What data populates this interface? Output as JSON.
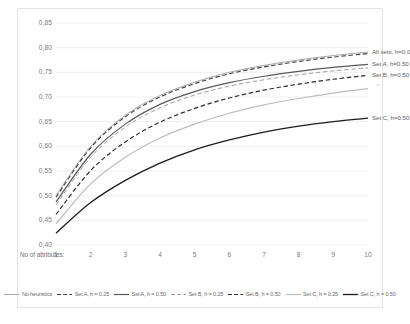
{
  "chart_data": {
    "type": "line",
    "title": "",
    "xlabel": "No of attributes:",
    "ylabel": "",
    "x": [
      1,
      2,
      3,
      4,
      5,
      6,
      7,
      8,
      9,
      10
    ],
    "xlim": [
      1,
      10
    ],
    "ylim": [
      0.4,
      0.85
    ],
    "yticks": [
      "0,40",
      "0,45",
      "0,50",
      "0,55",
      "0,60",
      "0,65",
      "0,70",
      "0,75",
      "0,80",
      "0,85"
    ],
    "ytick_values": [
      0.4,
      0.45,
      0.5,
      0.55,
      0.6,
      0.65,
      0.7,
      0.75,
      0.8,
      0.85
    ],
    "xticks": [
      "1",
      "2",
      "3",
      "4",
      "5",
      "6",
      "7",
      "8",
      "9",
      "10"
    ],
    "grid": "horizontal",
    "legend_position": "bottom",
    "series": [
      {
        "name": "No heuristics",
        "values": [
          0.5,
          0.6,
          0.663,
          0.703,
          0.73,
          0.75,
          0.764,
          0.775,
          0.784,
          0.791
        ],
        "color": "#a6a6a6",
        "style": "solid",
        "width": 1.0
      },
      {
        "name": "Set A, h = 0.25",
        "values": [
          0.497,
          0.597,
          0.66,
          0.7,
          0.727,
          0.747,
          0.761,
          0.772,
          0.781,
          0.788
        ],
        "color": "#3f3f3f",
        "style": "dashed",
        "width": 1.1
      },
      {
        "name": "Set A, h = 0.50",
        "values": [
          0.487,
          0.584,
          0.645,
          0.685,
          0.711,
          0.729,
          0.742,
          0.752,
          0.76,
          0.766
        ],
        "color": "#5a5a5a",
        "style": "solid",
        "width": 1.2
      },
      {
        "name": "Set B, h = 0.25",
        "values": [
          0.481,
          0.578,
          0.639,
          0.678,
          0.704,
          0.722,
          0.735,
          0.745,
          0.753,
          0.759
        ],
        "color": "#9e9e9e",
        "style": "dashed",
        "width": 1.0
      },
      {
        "name": "Set B, h = 0.50",
        "values": [
          0.462,
          0.551,
          0.609,
          0.649,
          0.677,
          0.698,
          0.714,
          0.726,
          0.736,
          0.744
        ],
        "color": "#2e2e2e",
        "style": "dashed",
        "width": 1.2
      },
      {
        "name": "Set C, h = 0.25",
        "values": [
          0.443,
          0.524,
          0.578,
          0.617,
          0.645,
          0.667,
          0.684,
          0.697,
          0.708,
          0.717
        ],
        "color": "#bdbdbd",
        "style": "solid",
        "width": 1.2
      },
      {
        "name": "Set C, h = 0.50",
        "values": [
          0.424,
          0.486,
          0.531,
          0.566,
          0.593,
          0.613,
          0.629,
          0.641,
          0.65,
          0.657
        ],
        "color": "#1c1c1c",
        "style": "solid",
        "width": 1.3
      }
    ],
    "annotations": [
      {
        "text": "All sets, h=0.0",
        "x": 10,
        "y": 0.791
      },
      {
        "text": "Set A, h=0.50",
        "x": 10,
        "y": 0.766
      },
      {
        "text": "Set B, h=0.50",
        "x": 10,
        "y": 0.744
      },
      {
        "text": "Set C, h=0.50",
        "x": 10,
        "y": 0.657
      }
    ]
  }
}
